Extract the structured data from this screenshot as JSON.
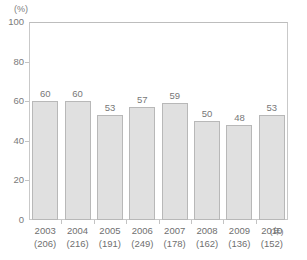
{
  "chart_data": {
    "type": "bar",
    "title": "",
    "subtitle": "",
    "xlabel": "",
    "ylabel": "",
    "unit_label": "(%)",
    "x_axis_unit": "(年)",
    "ylim": [
      0,
      100
    ],
    "yticks": [
      "0",
      "20",
      "40",
      "60",
      "80",
      "100"
    ],
    "ytick_values": [
      0,
      20,
      40,
      60,
      80,
      100
    ],
    "grid": false,
    "legend": null,
    "categories": [
      "2003",
      "2004",
      "2005",
      "2006",
      "2007",
      "2008",
      "2009",
      "2010"
    ],
    "category_sublabels": [
      "(206)",
      "(216)",
      "(191)",
      "(249)",
      "(178)",
      "(162)",
      "(136)",
      "(152)"
    ],
    "values": [
      60,
      60,
      53,
      57,
      59,
      50,
      48,
      53
    ],
    "value_labels": [
      "60",
      "60",
      "53",
      "57",
      "59",
      "50",
      "48",
      "53"
    ],
    "colors": {
      "bar_fill": "#e0e0e0",
      "bar_border": "#b8b8b8",
      "axis": "#c9c9c9",
      "text": "#6f6f6f"
    }
  }
}
